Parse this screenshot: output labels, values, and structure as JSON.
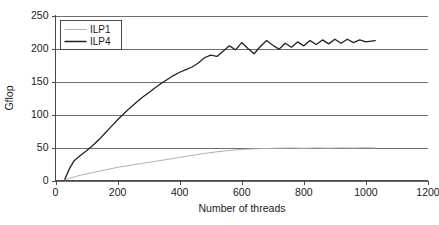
{
  "chart_data": {
    "type": "line",
    "title": "",
    "xlabel": "Number of threads",
    "ylabel": "Gflop",
    "xlim": [
      0,
      1200
    ],
    "ylim": [
      0,
      250
    ],
    "xticks": [
      0,
      200,
      400,
      600,
      800,
      1000,
      1200
    ],
    "yticks": [
      0,
      50,
      100,
      150,
      200,
      250
    ],
    "grid": "horizontal",
    "legend_position": "top-left-inside",
    "series": [
      {
        "name": "ILP1",
        "color": "#b0b0b0",
        "x": [
          30,
          50,
          80,
          120,
          160,
          200,
          240,
          280,
          320,
          360,
          400,
          440,
          480,
          520,
          560,
          600,
          640,
          680,
          720,
          760,
          800,
          840,
          880,
          920,
          960,
          1000,
          1030
        ],
        "y": [
          1,
          4,
          8,
          12,
          16,
          20,
          23,
          26,
          29,
          32,
          35,
          38,
          41,
          43.5,
          45.5,
          47,
          48,
          48.5,
          49,
          49.3,
          48.8,
          49.4,
          49,
          49.5,
          49.2,
          49.6,
          49.4
        ]
      },
      {
        "name": "ILP4",
        "color": "#222222",
        "x": [
          30,
          45,
          60,
          80,
          100,
          120,
          140,
          160,
          180,
          200,
          220,
          240,
          260,
          280,
          300,
          320,
          340,
          360,
          380,
          400,
          420,
          440,
          460,
          480,
          500,
          520,
          540,
          560,
          580,
          600,
          620,
          640,
          660,
          680,
          700,
          720,
          740,
          760,
          780,
          800,
          820,
          840,
          860,
          880,
          900,
          920,
          940,
          960,
          980,
          1000,
          1030
        ],
        "y": [
          2,
          18,
          30,
          38,
          45,
          53,
          62,
          72,
          82,
          92,
          101,
          110,
          118,
          126,
          133,
          140,
          147,
          153,
          159,
          164,
          168,
          172,
          178,
          186,
          190,
          188,
          196,
          204,
          198,
          209,
          200,
          192,
          203,
          212,
          205,
          199,
          208,
          202,
          210,
          204,
          212,
          206,
          213,
          207,
          214,
          208,
          214,
          209,
          213,
          210,
          212
        ]
      }
    ]
  },
  "legend": {
    "entries": [
      {
        "label": "ILP1"
      },
      {
        "label": "ILP4"
      }
    ]
  },
  "axes": {
    "y_title": "Gflop",
    "x_title": "Number of threads",
    "x_tick_labels": [
      "0",
      "200",
      "400",
      "600",
      "800",
      "1000",
      "1200"
    ],
    "y_tick_labels": [
      "0",
      "50",
      "100",
      "150",
      "200",
      "250"
    ]
  }
}
